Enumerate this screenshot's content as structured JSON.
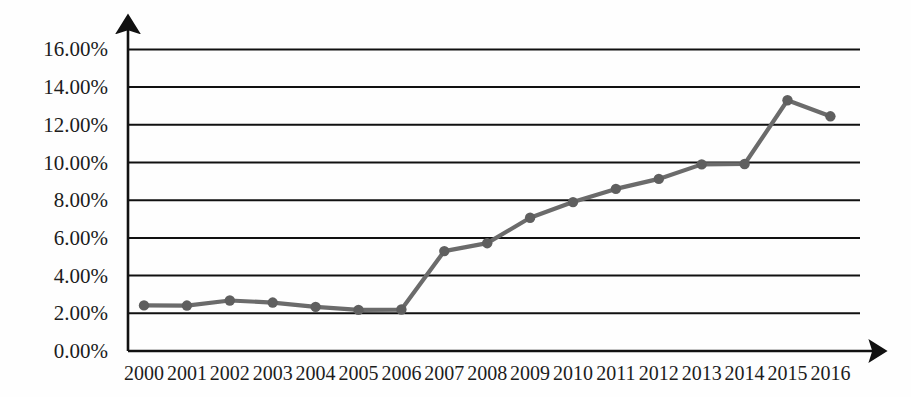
{
  "chart_data": {
    "type": "line",
    "title": "",
    "subtitle": "",
    "xlabel": "",
    "ylabel": "",
    "categories": [
      "2000",
      "2001",
      "2002",
      "2003",
      "2004",
      "2005",
      "2006",
      "2007",
      "2008",
      "2009",
      "2010",
      "2011",
      "2012",
      "2013",
      "2014",
      "2015",
      "2016"
    ],
    "values": [
      2.42,
      2.41,
      2.68,
      2.57,
      2.34,
      2.18,
      2.2,
      5.3,
      5.72,
      7.07,
      7.9,
      8.6,
      9.13,
      9.9,
      9.92,
      13.3,
      12.45
    ],
    "series": [
      {
        "name": "series-1",
        "values": [
          2.42,
          2.41,
          2.68,
          2.57,
          2.34,
          2.18,
          2.2,
          5.3,
          5.72,
          7.07,
          7.9,
          8.6,
          9.13,
          9.9,
          9.92,
          13.3,
          12.45
        ]
      }
    ],
    "ylim": [
      0,
      16
    ],
    "ytick_values": [
      0,
      2,
      4,
      6,
      8,
      10,
      12,
      14,
      16
    ],
    "ytick_labels": [
      "0.00%",
      "2.00%",
      "4.00%",
      "6.00%",
      "8.00%",
      "10.00%",
      "12.00%",
      "14.00%",
      "16.00%"
    ],
    "xtick_labels": [
      "2000",
      "2001",
      "2002",
      "2003",
      "2004",
      "2005",
      "2006",
      "2007",
      "2008",
      "2009",
      "2010",
      "2011",
      "2012",
      "2013",
      "2014",
      "2015",
      "2016"
    ],
    "grid": true,
    "grid_axis": "y",
    "legend": "none",
    "legend_position": "none",
    "markers": "circle",
    "annotations": [],
    "colors": {
      "line": "#6b6b6b",
      "marker": "#5f5f5f",
      "gridline": "#111111",
      "axis": "#111111",
      "text": "#1c1c1c",
      "background": "#ffffff"
    }
  }
}
